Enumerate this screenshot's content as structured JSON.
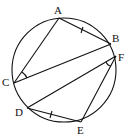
{
  "diagram": {
    "type": "inscribed-polygon-circle",
    "circle": {
      "cx": 64,
      "cy": 70,
      "r": 52
    },
    "points": {
      "A": {
        "label": "A",
        "x": 59,
        "y": 18
      },
      "B": {
        "label": "B",
        "x": 111,
        "y": 44
      },
      "F": {
        "label": "F",
        "x": 116,
        "y": 56
      },
      "C": {
        "label": "C",
        "x": 14,
        "y": 83
      },
      "D": {
        "label": "D",
        "x": 27,
        "y": 108
      },
      "E": {
        "label": "E",
        "x": 81,
        "y": 122
      }
    },
    "segments": [
      "AB",
      "AC",
      "CB",
      "DF",
      "DE",
      "EF"
    ],
    "equal_marks": [
      "AB",
      "DE"
    ],
    "angle_marks": [
      "ACB",
      "DFE"
    ],
    "stroke_color": "#111111"
  }
}
